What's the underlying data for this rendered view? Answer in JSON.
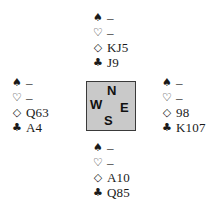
{
  "diagram": {
    "type": "bridge-deal",
    "suit_symbols": {
      "spades": "♠",
      "hearts": "♡",
      "diamonds": "◇",
      "clubs": "♣"
    },
    "compass": {
      "north": "N",
      "west": "W",
      "east": "E",
      "south": "S",
      "background_color": "#c9c9c9",
      "border_color": "#3a3a3a"
    },
    "hands": {
      "north": {
        "spades": "–",
        "hearts": "–",
        "diamonds": "KJ5",
        "clubs": "J9"
      },
      "west": {
        "spades": "–",
        "hearts": "–",
        "diamonds": "Q63",
        "clubs": "A4"
      },
      "east": {
        "spades": "–",
        "hearts": "–",
        "diamonds": "98",
        "clubs": "K107"
      },
      "south": {
        "spades": "–",
        "hearts": "–",
        "diamonds": "A10",
        "clubs": "Q85"
      }
    }
  }
}
